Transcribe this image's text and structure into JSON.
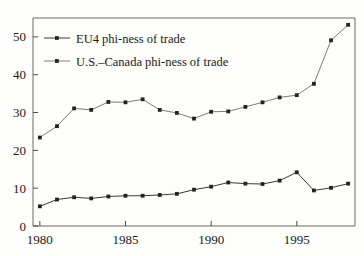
{
  "chart_data": {
    "type": "line",
    "title": "",
    "subtitle": "",
    "xlabel": "",
    "ylabel": "",
    "x": [
      1980,
      1981,
      1982,
      1983,
      1984,
      1985,
      1986,
      1987,
      1988,
      1989,
      1990,
      1991,
      1992,
      1993,
      1994,
      1995,
      1996,
      1997,
      1998
    ],
    "xlim": [
      1979.6,
      1998.4
    ],
    "ylim": [
      0,
      55
    ],
    "xticks": [
      1980,
      1985,
      1990,
      1995
    ],
    "xticklabels": [
      "1980",
      "1985",
      "1990",
      "1995"
    ],
    "yticks": [
      0,
      10,
      20,
      30,
      40,
      50
    ],
    "yticklabels": [
      "0",
      "10",
      "20",
      "30",
      "40",
      "50"
    ],
    "grid": false,
    "legend_position": "upper left",
    "series": [
      {
        "name": "EU4 phi-ness of trade",
        "color": "#23231f",
        "marker": "square",
        "values": [
          5.2,
          7.0,
          7.6,
          7.3,
          7.8,
          8.0,
          8.0,
          8.2,
          8.5,
          9.6,
          10.4,
          11.5,
          11.2,
          11.1,
          12.0,
          14.2,
          9.4,
          10.1,
          11.2
        ]
      },
      {
        "name": "U.S.–Canada phi-ness of trade",
        "color": "#6e6e69",
        "marker": "square",
        "values": [
          23.4,
          26.4,
          31.1,
          30.7,
          32.8,
          32.7,
          33.5,
          30.7,
          29.9,
          28.4,
          30.2,
          30.3,
          31.5,
          32.7,
          34.0,
          34.6,
          37.6,
          49.1,
          53.2
        ]
      }
    ]
  },
  "legend": {
    "entries": [
      {
        "label": "EU4 phi-ness of trade",
        "color": "#23231f"
      },
      {
        "label": "U.S.–Canada phi-ness of trade",
        "color": "#6e6e69"
      }
    ]
  },
  "axes": {
    "y_labels": [
      "50",
      "40",
      "30",
      "20",
      "10",
      "0"
    ],
    "x_labels": [
      "1980",
      "1985",
      "1990",
      "1995"
    ]
  },
  "colors": {
    "background": "#fdfdfb",
    "axis": "#4a4a48",
    "frame": "#6b6b68",
    "text": "#1a1a1a",
    "series_1": "#23231f",
    "series_2": "#6e6e69"
  }
}
